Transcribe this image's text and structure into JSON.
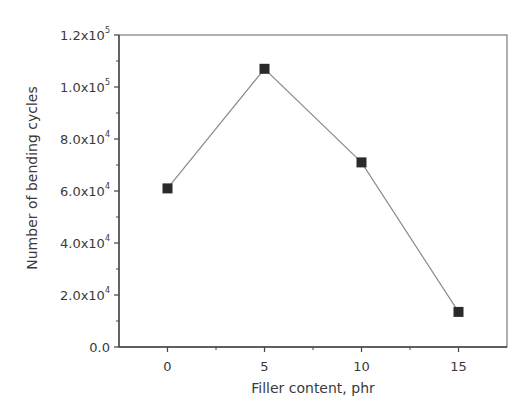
{
  "chart_data": {
    "type": "line",
    "title": "",
    "xlabel": "Filler content, phr",
    "ylabel": "Number of bending cycles",
    "x": [
      0,
      5,
      10,
      15
    ],
    "series": [
      {
        "name": "Number of bending cycles",
        "values": [
          61000,
          107000,
          71000,
          13500
        ],
        "marker": "square",
        "color": "#2a2a2a",
        "line_color": "#8a8a8a"
      }
    ],
    "xlim": [
      -2.5,
      17.5
    ],
    "ylim": [
      0,
      120000
    ],
    "xticks": [
      0,
      5,
      10,
      15
    ],
    "xtick_labels": [
      "0",
      "5",
      "10",
      "15"
    ],
    "yticks": [
      0,
      20000,
      40000,
      60000,
      80000,
      100000,
      120000
    ],
    "ytick_labels": [
      {
        "mantissa": "0.0",
        "exp": ""
      },
      {
        "mantissa": "2.0x10",
        "exp": "4"
      },
      {
        "mantissa": "4.0x10",
        "exp": "4"
      },
      {
        "mantissa": "6.0x10",
        "exp": "4"
      },
      {
        "mantissa": "8.0x10",
        "exp": "4"
      },
      {
        "mantissa": "1.0x10",
        "exp": "5"
      },
      {
        "mantissa": "1.2x10",
        "exp": "5"
      }
    ],
    "grid": false,
    "legend": null
  }
}
